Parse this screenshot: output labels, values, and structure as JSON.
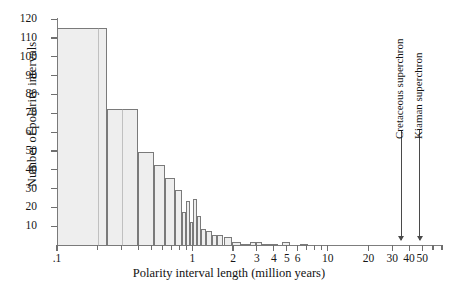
{
  "chart_data": {
    "type": "bar",
    "title": "",
    "subtitle": "",
    "xlabel": "Polarity interval length (million years)",
    "ylabel": "Number of polarity intervals",
    "xscale": "log",
    "xlim": [
      0.1,
      70
    ],
    "ylim": [
      0,
      120
    ],
    "yticks": [
      10,
      20,
      30,
      40,
      50,
      60,
      70,
      80,
      90,
      100,
      110,
      120
    ],
    "ytick_labels": [
      "10",
      "20",
      "30",
      "40",
      "50",
      "60",
      "70",
      "80",
      "90",
      "100",
      "110",
      "120"
    ],
    "xticks": [
      0.1,
      1,
      2,
      3,
      4,
      5,
      6,
      10,
      20,
      30,
      40,
      50
    ],
    "xtick_labels": [
      ".1",
      "1",
      "2",
      "3",
      "4",
      "5",
      "6",
      "10",
      "20",
      "30",
      "40",
      "50"
    ],
    "grid": false,
    "legend": "none",
    "bins_note": "logarithmic bins of polarity interval length",
    "bins": [
      {
        "x0": 0.1,
        "x1": 0.235,
        "value": 116
      },
      {
        "x0": 0.235,
        "x1": 0.4,
        "value": 73
      },
      {
        "x0": 0.4,
        "x1": 0.52,
        "value": 50
      },
      {
        "x0": 0.52,
        "x1": 0.625,
        "value": 43
      },
      {
        "x0": 0.625,
        "x1": 0.745,
        "value": 36
      },
      {
        "x0": 0.745,
        "x1": 0.845,
        "value": 30
      },
      {
        "x0": 0.845,
        "x1": 0.905,
        "value": 18
      },
      {
        "x0": 0.905,
        "x1": 0.965,
        "value": 24
      },
      {
        "x0": 0.965,
        "x1": 1.02,
        "value": 13
      },
      {
        "x0": 1.02,
        "x1": 1.09,
        "value": 25
      },
      {
        "x0": 1.09,
        "x1": 1.16,
        "value": 16
      },
      {
        "x0": 1.16,
        "x1": 1.255,
        "value": 9
      },
      {
        "x0": 1.255,
        "x1": 1.39,
        "value": 8
      },
      {
        "x0": 1.39,
        "x1": 1.52,
        "value": 6
      },
      {
        "x0": 1.52,
        "x1": 1.7,
        "value": 6
      },
      {
        "x0": 1.7,
        "x1": 1.95,
        "value": 5
      },
      {
        "x0": 1.95,
        "x1": 2.3,
        "value": 2
      },
      {
        "x0": 2.3,
        "x1": 2.65,
        "value": 1
      },
      {
        "x0": 2.65,
        "x1": 2.95,
        "value": 2
      },
      {
        "x0": 2.95,
        "x1": 3.3,
        "value": 2
      },
      {
        "x0": 3.3,
        "x1": 3.7,
        "value": 1
      },
      {
        "x0": 3.7,
        "x1": 4.3,
        "value": 1
      },
      {
        "x0": 4.6,
        "x1": 5.3,
        "value": 2
      },
      {
        "x0": 6.2,
        "x1": 7.2,
        "value": 1
      }
    ],
    "annotations": [
      {
        "label": "Cretaceous superchron",
        "x": 35
      },
      {
        "label": "Kiaman superchron",
        "x": 48
      }
    ]
  }
}
